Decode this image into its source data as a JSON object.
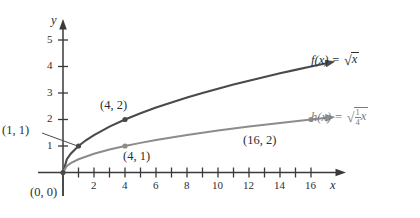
{
  "figure": {
    "axis_labels": {
      "x": "x",
      "y": "y"
    },
    "colors": {
      "curve_f": "#4a4a4a",
      "curve_h": "#8c8c8c",
      "axis": "#3a3a3a",
      "text": "#2e2e2e",
      "background": "#ffffff"
    }
  },
  "chart_data": {
    "type": "line",
    "title": "",
    "xlabel": "x",
    "ylabel": "y",
    "xlim": [
      -1,
      18
    ],
    "ylim": [
      -0.6,
      5.8
    ],
    "grid": false,
    "legend": "inline-labels-right",
    "xticks": [
      0,
      1,
      2,
      3,
      4,
      5,
      6,
      7,
      8,
      9,
      10,
      11,
      12,
      13,
      14,
      15,
      16,
      17
    ],
    "xtick_labels": [
      "2",
      "4",
      "6",
      "8",
      "10",
      "12",
      "14",
      "16"
    ],
    "xtick_labeled_values": [
      2,
      4,
      6,
      8,
      10,
      12,
      14,
      16
    ],
    "yticks": [
      1,
      2,
      3,
      4,
      5
    ],
    "ytick_labels": [
      "1",
      "2",
      "3",
      "4",
      "5"
    ],
    "series": [
      {
        "name": "f(x) = √x",
        "formula_text": "f(x) = ",
        "radicand": "x",
        "color": "#4a4a4a",
        "x": [
          0,
          0.25,
          0.5,
          1,
          1.5,
          2,
          3,
          4,
          5,
          6,
          7,
          8,
          9,
          10,
          11,
          12,
          13,
          14,
          15,
          16,
          17
        ],
        "y": [
          0,
          0.5,
          0.707,
          1,
          1.225,
          1.414,
          1.732,
          2,
          2.236,
          2.449,
          2.646,
          2.828,
          3,
          3.162,
          3.317,
          3.464,
          3.606,
          3.742,
          3.873,
          4,
          4.123
        ],
        "points": [
          {
            "label": "(0, 0)",
            "x": 0,
            "y": 0
          },
          {
            "label": "(1, 1)",
            "x": 1,
            "y": 1
          },
          {
            "label": "(4, 2)",
            "x": 4,
            "y": 2
          }
        ]
      },
      {
        "name": "h(x) = √(1/4 x)",
        "formula_text": "h(x) = ",
        "radicand_numerator": "1",
        "radicand_denominator": "4",
        "radicand_variable": "x",
        "color": "#8c8c8c",
        "x": [
          0,
          0.25,
          0.5,
          1,
          2,
          3,
          4,
          5,
          6,
          7,
          8,
          9,
          10,
          11,
          12,
          13,
          14,
          15,
          16,
          17
        ],
        "y": [
          0,
          0.25,
          0.354,
          0.5,
          0.707,
          0.866,
          1,
          1.118,
          1.225,
          1.323,
          1.414,
          1.5,
          1.581,
          1.658,
          1.732,
          1.803,
          1.871,
          1.936,
          2,
          2.062
        ],
        "points": [
          {
            "label": "(4, 1)",
            "x": 4,
            "y": 1
          },
          {
            "label": "(16, 2)",
            "x": 16,
            "y": 2
          }
        ]
      }
    ],
    "annotations": [
      {
        "text": "(0, 0)",
        "for": "origin"
      },
      {
        "text": "(1, 1)",
        "for": "f at x=1"
      },
      {
        "text": "(4, 2)",
        "for": "f at x=4"
      },
      {
        "text": "(4, 1)",
        "for": "h at x=4"
      },
      {
        "text": "(16, 2)",
        "for": "h at x=16"
      }
    ]
  },
  "labels": {
    "y_axis": "y",
    "x_axis": "x",
    "y_tick_5": "5",
    "y_tick_4": "4",
    "y_tick_3": "3",
    "y_tick_2": "2",
    "y_tick_1": "1",
    "x_tick_2": "2",
    "x_tick_4": "4",
    "x_tick_6": "6",
    "x_tick_8": "8",
    "x_tick_10": "10",
    "x_tick_12": "12",
    "x_tick_14": "14",
    "x_tick_16": "16",
    "pt_origin": "(0, 0)",
    "pt_1_1": "(1, 1)",
    "pt_4_2": "(4, 2)",
    "pt_4_1": "(4, 1)",
    "pt_16_2": "(16, 2)",
    "fn_f_lhs": "f(x) =",
    "fn_f_radicand": "x",
    "fn_h_lhs": "h(x) =",
    "fn_h_num": "1",
    "fn_h_den": "4",
    "fn_h_var": "x"
  }
}
